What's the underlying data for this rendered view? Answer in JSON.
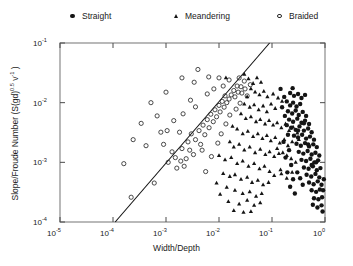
{
  "legend": {
    "entries": [
      {
        "label": "Straight",
        "marker": "filled-circle-icon",
        "x": 68,
        "color": "#141414"
      },
      {
        "label": "Meandering",
        "marker": "triangle-icon",
        "x": 171,
        "color": "#141414"
      },
      {
        "label": "Braided",
        "marker": "open-circle-icon",
        "x": 275,
        "color": "#2a2a2a"
      }
    ]
  },
  "chart_data": {
    "type": "scatter",
    "title": "",
    "xlabel": "Width/Depth",
    "ylabel": "Slope/Froude Number (S(gd)0.5 v-1)",
    "ylabel_parts": {
      "base": "Slope/Froude Number (S(gd)",
      "exp1": "0.5",
      "mid": " v",
      "exp2": "-1",
      "close": " )"
    },
    "xscale": "log",
    "yscale": "log",
    "xlim": [
      1e-05,
      1.0
    ],
    "ylim": [
      0.0001,
      0.1
    ],
    "xticks": [
      1e-05,
      0.0001,
      0.001,
      0.01,
      0.1,
      1
    ],
    "yticks": [
      0.0001,
      0.001,
      0.01,
      0.1
    ],
    "xtick_labels": [
      "10-5",
      "10-4",
      "10-3",
      "10-2",
      "10-1",
      "100"
    ],
    "ytick_labels": [
      "10-4",
      "10-3",
      "10-2",
      "10-1"
    ],
    "xtick_mantissa": "10",
    "xtick_exponents": [
      "-5",
      "-4",
      "-3",
      "-2",
      "-1",
      "0"
    ],
    "ytick_exponents": [
      "-4",
      "-3",
      "-2",
      "-1"
    ],
    "grid": false,
    "legend_position": "above-plot",
    "reference_line": {
      "name": "threshold-line",
      "x": [
        0.00011,
        0.09
      ],
      "y": [
        0.0001,
        0.1
      ],
      "color": "#111111",
      "width": 1.1
    },
    "series": [
      {
        "name": "Braided",
        "marker": "open-circle",
        "color": "#2a2a2a",
        "points": [
          [
            0.00022,
            0.00026
          ],
          [
            0.00016,
            0.00095
          ],
          [
            0.0006,
            0.00045
          ],
          [
            0.00042,
            0.0019
          ],
          [
            0.0011,
            0.001
          ],
          [
            0.0015,
            0.0012
          ],
          [
            0.0019,
            0.00105
          ],
          [
            0.0024,
            0.00115
          ],
          [
            0.0013,
            0.0015
          ],
          [
            0.002,
            0.0017
          ],
          [
            0.0028,
            0.0016
          ],
          [
            0.0033,
            0.00135
          ],
          [
            0.0026,
            0.0022
          ],
          [
            0.0036,
            0.0024
          ],
          [
            0.0045,
            0.002
          ],
          [
            0.003,
            0.003
          ],
          [
            0.0042,
            0.0034
          ],
          [
            0.0054,
            0.0029
          ],
          [
            0.005,
            0.0042
          ],
          [
            0.0065,
            0.0038
          ],
          [
            0.006,
            0.0052
          ],
          [
            0.0078,
            0.0048
          ],
          [
            0.007,
            0.0064
          ],
          [
            0.009,
            0.0058
          ],
          [
            0.0084,
            0.0076
          ],
          [
            0.0105,
            0.007
          ],
          [
            0.01,
            0.009
          ],
          [
            0.0125,
            0.0084
          ],
          [
            0.0115,
            0.0105
          ],
          [
            0.014,
            0.01
          ],
          [
            0.0155,
            0.0115
          ],
          [
            0.013,
            0.013
          ],
          [
            0.017,
            0.0135
          ],
          [
            0.02,
            0.0125
          ],
          [
            0.019,
            0.016
          ],
          [
            0.023,
            0.015
          ],
          [
            0.027,
            0.0145
          ],
          [
            0.022,
            0.019
          ],
          [
            0.026,
            0.0185
          ],
          [
            0.031,
            0.017
          ],
          [
            0.0155,
            0.024
          ],
          [
            0.01,
            0.026
          ],
          [
            0.0064,
            0.027
          ],
          [
            0.0034,
            0.022
          ],
          [
            0.002,
            0.026
          ],
          [
            0.004,
            0.036
          ],
          [
            0.0008,
            0.0032
          ],
          [
            0.00105,
            0.0034
          ],
          [
            0.0014,
            0.005
          ],
          [
            0.0021,
            0.0065
          ],
          [
            0.00068,
            0.006
          ],
          [
            0.00052,
            0.01
          ],
          [
            0.001,
            0.015
          ],
          [
            0.0029,
            0.011
          ],
          [
            0.0036,
            0.0085
          ],
          [
            0.0018,
            0.0032
          ],
          [
            0.0009,
            0.002
          ],
          [
            0.00034,
            0.0045
          ],
          [
            0.00024,
            0.0024
          ],
          [
            0.006,
            0.014
          ],
          [
            0.008,
            0.017
          ],
          [
            0.012,
            0.019
          ],
          [
            0.024,
            0.026
          ],
          [
            0.03,
            0.023
          ],
          [
            0.0016,
            0.0008
          ],
          [
            0.0022,
            0.00086
          ],
          [
            0.0048,
            0.0016
          ],
          [
            0.0056,
            0.0007
          ],
          [
            0.0072,
            0.00125
          ],
          [
            0.0095,
            0.0021
          ],
          [
            0.011,
            0.003
          ],
          [
            0.0135,
            0.0044
          ],
          [
            0.016,
            0.0062
          ],
          [
            0.021,
            0.0078
          ],
          [
            0.025,
            0.0098
          ],
          [
            0.034,
            0.013
          ],
          [
            0.039,
            0.02
          ]
        ]
      },
      {
        "name": "Meandering",
        "marker": "triangle",
        "color": "#141414",
        "points": [
          [
            0.03,
            0.03
          ],
          [
            0.036,
            0.025
          ],
          [
            0.044,
            0.021
          ],
          [
            0.052,
            0.026
          ],
          [
            0.062,
            0.022
          ],
          [
            0.04,
            0.017
          ],
          [
            0.048,
            0.015
          ],
          [
            0.058,
            0.0135
          ],
          [
            0.07,
            0.0155
          ],
          [
            0.082,
            0.0125
          ],
          [
            0.034,
            0.0125
          ],
          [
            0.03,
            0.0095
          ],
          [
            0.038,
            0.0084
          ],
          [
            0.046,
            0.0092
          ],
          [
            0.056,
            0.0076
          ],
          [
            0.068,
            0.0088
          ],
          [
            0.08,
            0.007
          ],
          [
            0.096,
            0.0095
          ],
          [
            0.115,
            0.008
          ],
          [
            0.105,
            0.014
          ],
          [
            0.13,
            0.012
          ],
          [
            0.155,
            0.0105
          ],
          [
            0.026,
            0.0065
          ],
          [
            0.032,
            0.0054
          ],
          [
            0.04,
            0.0058
          ],
          [
            0.05,
            0.0048
          ],
          [
            0.06,
            0.0052
          ],
          [
            0.074,
            0.0044
          ],
          [
            0.088,
            0.005
          ],
          [
            0.105,
            0.0042
          ],
          [
            0.125,
            0.0046
          ],
          [
            0.15,
            0.0038
          ],
          [
            0.18,
            0.0044
          ],
          [
            0.21,
            0.0034
          ],
          [
            0.25,
            0.0039
          ],
          [
            0.3,
            0.0031
          ],
          [
            0.022,
            0.0036
          ],
          [
            0.028,
            0.003
          ],
          [
            0.035,
            0.0033
          ],
          [
            0.044,
            0.0027
          ],
          [
            0.054,
            0.003
          ],
          [
            0.066,
            0.0025
          ],
          [
            0.08,
            0.0028
          ],
          [
            0.095,
            0.0023
          ],
          [
            0.115,
            0.0026
          ],
          [
            0.14,
            0.0021
          ],
          [
            0.17,
            0.0024
          ],
          [
            0.2,
            0.0019
          ],
          [
            0.24,
            0.0022
          ],
          [
            0.016,
            0.0022
          ],
          [
            0.019,
            0.0018
          ],
          [
            0.024,
            0.002
          ],
          [
            0.03,
            0.0016
          ],
          [
            0.038,
            0.0018
          ],
          [
            0.048,
            0.00145
          ],
          [
            0.06,
            0.00165
          ],
          [
            0.075,
            0.00135
          ],
          [
            0.09,
            0.0015
          ],
          [
            0.11,
            0.00125
          ],
          [
            0.135,
            0.0014
          ],
          [
            0.01,
            0.0013
          ],
          [
            0.013,
            0.0011
          ],
          [
            0.017,
            0.0012
          ],
          [
            0.022,
            0.00095
          ],
          [
            0.028,
            0.00105
          ],
          [
            0.036,
            0.00086
          ],
          [
            0.046,
            0.00095
          ],
          [
            0.058,
            0.00078
          ],
          [
            0.072,
            0.00086
          ],
          [
            0.09,
            0.0007
          ],
          [
            0.012,
            0.00065
          ],
          [
            0.016,
            0.00058
          ],
          [
            0.02,
            0.00062
          ],
          [
            0.026,
            0.00052
          ],
          [
            0.034,
            0.00056
          ],
          [
            0.042,
            0.00046
          ],
          [
            0.054,
            0.0005
          ],
          [
            0.068,
            0.00042
          ],
          [
            0.086,
            0.00046
          ],
          [
            0.11,
            0.0006
          ],
          [
            0.145,
            0.00075
          ],
          [
            0.02,
            0.00034
          ],
          [
            0.028,
            0.0003
          ],
          [
            0.038,
            0.00032
          ],
          [
            0.05,
            0.00027
          ],
          [
            0.064,
            0.0003
          ],
          [
            0.014,
            0.00038
          ],
          [
            0.009,
            0.00045
          ],
          [
            0.0105,
            0.00029
          ],
          [
            0.015,
            0.00022
          ],
          [
            0.024,
            0.0002
          ],
          [
            0.034,
            0.00023
          ],
          [
            0.046,
            0.00019
          ],
          [
            0.06,
            0.00021
          ],
          [
            0.029,
            0.000145
          ],
          [
            0.04,
            0.00015
          ],
          [
            0.019,
            0.000155
          ],
          [
            0.125,
            0.0017
          ],
          [
            0.16,
            0.00145
          ],
          [
            0.19,
            0.0013
          ],
          [
            0.23,
            0.00115
          ],
          [
            0.28,
            0.001
          ],
          [
            0.15,
            0.00064
          ],
          [
            0.19,
            0.00054
          ],
          [
            0.24,
            0.00068
          ],
          [
            0.32,
            0.0024
          ],
          [
            0.0135,
            0.026
          ],
          [
            0.018,
            0.004
          ]
        ]
      },
      {
        "name": "Straight",
        "marker": "filled-circle",
        "color": "#141414",
        "points": [
          [
            0.19,
            0.0105
          ],
          [
            0.22,
            0.009
          ],
          [
            0.25,
            0.01
          ],
          [
            0.29,
            0.0086
          ],
          [
            0.34,
            0.0095
          ],
          [
            0.2,
            0.0072
          ],
          [
            0.24,
            0.0066
          ],
          [
            0.28,
            0.0074
          ],
          [
            0.32,
            0.0062
          ],
          [
            0.38,
            0.007
          ],
          [
            0.44,
            0.006
          ],
          [
            0.21,
            0.0052
          ],
          [
            0.25,
            0.0048
          ],
          [
            0.3,
            0.0054
          ],
          [
            0.36,
            0.0046
          ],
          [
            0.42,
            0.005
          ],
          [
            0.5,
            0.0044
          ],
          [
            0.23,
            0.0038
          ],
          [
            0.28,
            0.0035
          ],
          [
            0.33,
            0.004
          ],
          [
            0.4,
            0.0034
          ],
          [
            0.48,
            0.0037
          ],
          [
            0.56,
            0.0032
          ],
          [
            0.26,
            0.0028
          ],
          [
            0.31,
            0.0026
          ],
          [
            0.37,
            0.0029
          ],
          [
            0.44,
            0.0025
          ],
          [
            0.52,
            0.0027
          ],
          [
            0.62,
            0.0024
          ],
          [
            0.29,
            0.00205
          ],
          [
            0.35,
            0.0019
          ],
          [
            0.42,
            0.0021
          ],
          [
            0.5,
            0.00185
          ],
          [
            0.6,
            0.002
          ],
          [
            0.7,
            0.0018
          ],
          [
            0.32,
            0.0015
          ],
          [
            0.39,
            0.0014
          ],
          [
            0.47,
            0.00155
          ],
          [
            0.56,
            0.00135
          ],
          [
            0.66,
            0.00145
          ],
          [
            0.78,
            0.0013
          ],
          [
            0.36,
            0.0011
          ],
          [
            0.44,
            0.00105
          ],
          [
            0.53,
            0.00115
          ],
          [
            0.63,
            0.001
          ],
          [
            0.74,
            0.00108
          ],
          [
            0.4,
            0.00082
          ],
          [
            0.49,
            0.00078
          ],
          [
            0.59,
            0.00086
          ],
          [
            0.7,
            0.00074
          ],
          [
            0.82,
            0.0008
          ],
          [
            0.45,
            0.00062
          ],
          [
            0.55,
            0.00058
          ],
          [
            0.66,
            0.00064
          ],
          [
            0.78,
            0.00056
          ],
          [
            0.5,
            0.00046
          ],
          [
            0.61,
            0.00043
          ],
          [
            0.73,
            0.00048
          ],
          [
            0.86,
            0.00042
          ],
          [
            0.56,
            0.00034
          ],
          [
            0.68,
            0.00032
          ],
          [
            0.8,
            0.00035
          ],
          [
            0.62,
            0.00025
          ],
          [
            0.75,
            0.00024
          ],
          [
            0.88,
            0.00026
          ],
          [
            0.22,
            0.0145
          ],
          [
            0.26,
            0.013
          ],
          [
            0.31,
            0.014
          ],
          [
            0.17,
            0.0125
          ],
          [
            0.36,
            0.012
          ],
          [
            0.42,
            0.0135
          ],
          [
            0.155,
            0.0084
          ],
          [
            0.175,
            0.006
          ],
          [
            0.19,
            0.0042
          ],
          [
            0.2,
            0.0029
          ],
          [
            0.165,
            0.0022
          ],
          [
            0.21,
            0.0016
          ],
          [
            0.18,
            0.0012
          ],
          [
            0.23,
            0.0009
          ],
          [
            0.195,
            0.00068
          ],
          [
            0.25,
            0.00052
          ],
          [
            0.22,
            0.00039
          ],
          [
            0.27,
            0.0003
          ],
          [
            0.3,
            0.00068
          ],
          [
            0.34,
            0.00054
          ],
          [
            0.38,
            0.00042
          ],
          [
            0.92,
            0.00034
          ],
          [
            0.95,
            0.00052
          ],
          [
            0.86,
            0.00019
          ],
          [
            0.72,
            0.000175
          ],
          [
            0.59,
            0.000195
          ],
          [
            0.9,
            0.00015
          ],
          [
            0.48,
            0.002
          ],
          [
            0.56,
            0.0009
          ],
          [
            0.68,
            0.001
          ],
          [
            0.145,
            0.017
          ],
          [
            0.245,
            0.0175
          ],
          [
            0.31,
            0.0034
          ],
          [
            0.4,
            0.0045
          ]
        ]
      }
    ]
  }
}
